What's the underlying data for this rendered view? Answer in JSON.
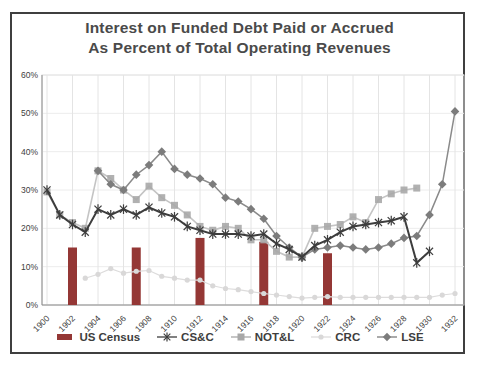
{
  "title": {
    "line1": "Interest on Funded Debt Paid or Accrued",
    "line2": "As Percent of Total Operating Revenues"
  },
  "y_axis": {
    "ticks": [
      0,
      10,
      20,
      30,
      40,
      50,
      60
    ],
    "labels": [
      "0%",
      "10%",
      "20%",
      "30%",
      "40%",
      "50%",
      "60%"
    ]
  },
  "x_axis": {
    "labels": [
      "1900",
      "1902",
      "1904",
      "1906",
      "1908",
      "1910",
      "1912",
      "1914",
      "1916",
      "1918",
      "1920",
      "1922",
      "1924",
      "1926",
      "1928",
      "1930",
      "1932"
    ]
  },
  "legend": [
    {
      "label": "US Census",
      "marker": "bar",
      "color": "#943735"
    },
    {
      "label": "CS&C",
      "marker": "asterisk",
      "color": "#3d3d3d"
    },
    {
      "label": "NOT&L",
      "marker": "square",
      "color": "#a8a8a8"
    },
    {
      "label": "CRC",
      "marker": "circle",
      "color": "#d9d8d8"
    },
    {
      "label": "LSE",
      "marker": "diamond",
      "color": "#7c7c7c"
    }
  ],
  "colors": {
    "grid_vertical": "#e4e4e4",
    "grid_horizontal": "#ececec",
    "axis": "#8c8c8c",
    "plot_frame": "#dcdcdc",
    "title_text": "#4a4a4a",
    "tick_text": "#404040"
  },
  "chart_data": {
    "type": "bar+line combo",
    "title": "Interest on Funded Debt Paid or Accrued As Percent of Total Operating Revenues",
    "xlabel": "Year",
    "ylabel": "Percent of total operating revenues",
    "ylim": [
      0,
      60
    ],
    "y_tick_step": 10,
    "x": [
      1900,
      1901,
      1902,
      1903,
      1904,
      1905,
      1906,
      1907,
      1908,
      1909,
      1910,
      1911,
      1912,
      1913,
      1914,
      1915,
      1916,
      1917,
      1918,
      1919,
      1920,
      1921,
      1922,
      1923,
      1924,
      1925,
      1926,
      1927,
      1928,
      1929,
      1930,
      1931,
      1932
    ],
    "series": [
      {
        "name": "US Census",
        "type": "bar",
        "color": "#943735",
        "values": [
          null,
          null,
          15,
          null,
          null,
          null,
          null,
          15,
          null,
          null,
          null,
          null,
          17.5,
          null,
          null,
          null,
          null,
          16.5,
          null,
          null,
          null,
          null,
          13.5,
          null,
          null,
          null,
          null,
          null,
          null,
          null,
          null,
          null,
          null
        ]
      },
      {
        "name": "CS&C",
        "type": "line",
        "marker": "asterisk",
        "color": "#3d3d3d",
        "line_color": "#3d3d3d",
        "line_width": 2,
        "values": [
          30,
          23.5,
          21,
          19,
          25,
          23.5,
          25,
          23.5,
          25.5,
          24,
          23,
          20.5,
          19.5,
          18.5,
          18.5,
          18.5,
          18,
          18.5,
          16,
          14.5,
          12.5,
          15.5,
          17,
          19,
          20.5,
          21,
          21.5,
          22,
          23,
          11,
          14,
          null,
          null
        ]
      },
      {
        "name": "NOT&L",
        "type": "line",
        "marker": "square",
        "color": "#a8a8a8",
        "line_color": "#c4c4c4",
        "line_width": 1.6,
        "values": [
          29.5,
          23.5,
          21.5,
          20,
          35,
          33,
          30,
          27.5,
          31,
          28,
          26,
          23.5,
          20.5,
          19.5,
          20.5,
          20,
          17,
          17,
          14,
          12.5,
          12.5,
          20,
          20.5,
          21,
          23,
          21.5,
          27.5,
          29,
          30,
          30.5,
          null,
          null,
          null
        ]
      },
      {
        "name": "CRC",
        "type": "line",
        "marker": "circle",
        "color": "#d9d8d8",
        "line_color": "#dddcdc",
        "line_width": 1.2,
        "values": [
          null,
          null,
          null,
          7,
          8,
          9.5,
          8.3,
          8.8,
          9,
          7.5,
          7,
          6.5,
          6.5,
          5,
          4.3,
          4,
          3.5,
          3,
          2.6,
          2.2,
          1.8,
          2,
          2.2,
          2,
          2,
          2,
          2,
          2,
          2,
          2,
          2,
          2.6,
          3
        ]
      },
      {
        "name": "LSE",
        "type": "line",
        "marker": "diamond",
        "color": "#7c7c7c",
        "line_color": "#8a8a8a",
        "line_width": 1.5,
        "values": [
          null,
          null,
          null,
          null,
          35,
          31.5,
          30,
          34,
          36.5,
          40,
          35.5,
          34,
          33,
          31.5,
          28,
          27,
          25,
          22.5,
          18,
          15,
          12.5,
          14.5,
          15,
          15.5,
          15,
          14.5,
          15,
          16,
          17.5,
          18,
          23.5,
          31.5,
          50.5
        ]
      }
    ],
    "legend_position": "bottom",
    "grid": "vertical lines at 2-year ticks, faint horizontal lines at 10% steps"
  }
}
